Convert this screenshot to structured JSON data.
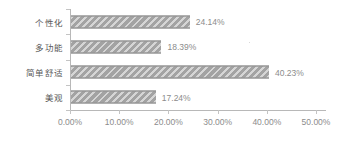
{
  "chart_data": {
    "type": "bar",
    "orientation": "horizontal",
    "title": "",
    "xlabel": "",
    "ylabel": "",
    "categories": [
      "个性化",
      "多功能",
      "简单舒适",
      "美观"
    ],
    "values": [
      24.14,
      18.39,
      40.23,
      17.24
    ],
    "value_labels": [
      "24.14%",
      "18.39%",
      "40.23%",
      "17.24%"
    ],
    "series": [
      {
        "name": "",
        "values": [
          24.14,
          18.39,
          40.23,
          17.24
        ]
      }
    ],
    "xlim": [
      0,
      50
    ],
    "xticks": [
      0,
      10,
      20,
      30,
      40,
      50
    ],
    "xtick_labels": [
      "0.00%",
      "10.00%",
      "20.00%",
      "30.00%",
      "40.00%",
      "50.00%"
    ],
    "grid": false,
    "legend": false,
    "legend_position": "none",
    "bar_color": "#a3a3a3",
    "bar_pattern": "diagonal-hatch",
    "axis_color": "#b8b8b8",
    "label_color": "#8c8c8c",
    "category_label_color": "#595959",
    "background_color": "#ffffff"
  }
}
